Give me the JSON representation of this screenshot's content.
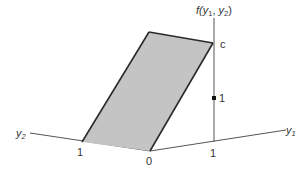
{
  "diagram": {
    "title_label": {
      "prefix": "f(",
      "v1": "y",
      "s1": "1",
      "sep": ", ",
      "v2": "y",
      "s2": "2",
      "suffix": ")"
    },
    "axes": {
      "y1": {
        "var": "y",
        "sub": "1"
      },
      "y2": {
        "var": "y",
        "sub": "2"
      }
    },
    "ticks": {
      "origin": "0",
      "y1_one": "1",
      "y2_one": "1",
      "f_one": "1",
      "f_c": "c"
    },
    "colors": {
      "region_fill": "#c4c4c4",
      "outline": "#2a2a2a",
      "axis": "#555555"
    }
  }
}
